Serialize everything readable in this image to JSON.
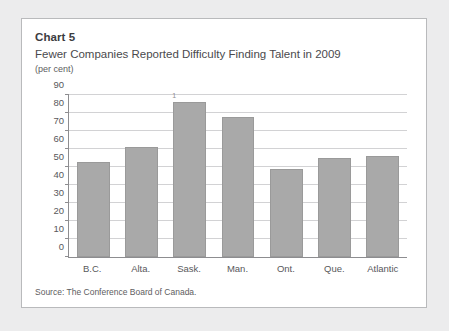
{
  "card": {
    "chart_number": "Chart 5",
    "title": "Fewer Companies Reported Difficulty Finding Talent in 2009",
    "units": "(per cent)",
    "source": "Source: The Conference Board of Canada."
  },
  "chart_data": {
    "type": "bar",
    "title": "Fewer Companies Reported Difficulty Finding Talent in 2009",
    "subtitle": "Chart 5",
    "xlabel": "",
    "ylabel": "(per cent)",
    "ylim": [
      0,
      90
    ],
    "yticks": [
      0,
      10,
      20,
      30,
      40,
      50,
      60,
      70,
      80,
      90
    ],
    "ytick_labels": [
      "0",
      "10",
      "20",
      "30",
      "40",
      "50",
      "60",
      "70",
      "80",
      "90"
    ],
    "grid": true,
    "legend": false,
    "categories": [
      "B.C.",
      "Alta.",
      "Sask.",
      "Man.",
      "Ont.",
      "Que.",
      "Atlantic"
    ],
    "values": [
      53,
      61,
      86,
      78,
      49,
      55,
      56
    ],
    "annotations": [
      {
        "category": "Sask.",
        "text": "1",
        "kind": "footnote-marker"
      }
    ],
    "bar_color": "#a9a9a9",
    "source": "Source: The Conference Board of Canada."
  }
}
